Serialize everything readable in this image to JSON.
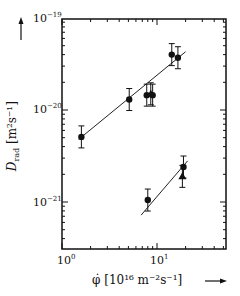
{
  "chart_data": {
    "type": "scatter",
    "title": "",
    "xlabel": "φ̇ [10^16 m^-2 s^-1]",
    "ylabel": "D_rad [m^2 s^-1]",
    "xscale": "log",
    "yscale": "log",
    "xlim": [
      1,
      30
    ],
    "ylim": [
      7e-22,
      1e-19
    ],
    "x_tick_labels": [
      "10^0",
      "10^1"
    ],
    "y_tick_labels": [
      "10^-19",
      "10^-20",
      "10^-21"
    ],
    "grid": false,
    "legend": "none",
    "series": [
      {
        "name": "upper set (circles)",
        "marker": "circle",
        "points": [
          [
            1.6,
            5.1e-21
          ],
          [
            5.1,
            1.3e-20
          ],
          [
            7.8,
            1.45e-20
          ],
          [
            9.0,
            1.45e-20
          ],
          [
            14.3,
            4e-20
          ],
          [
            16.6,
            3.7e-20
          ]
        ]
      },
      {
        "name": "upper set (triangles)",
        "marker": "triangle",
        "points": [
          [
            8.6,
            1.5e-20
          ]
        ]
      },
      {
        "name": "lower set (circles)",
        "marker": "circle",
        "points": [
          [
            8.0,
            1.05e-21
          ],
          [
            19.0,
            2.4e-21
          ]
        ]
      },
      {
        "name": "lower set (triangles)",
        "marker": "triangle",
        "points": [
          [
            18.5,
            1.9e-21
          ]
        ]
      }
    ],
    "fit_lines": [
      {
        "name": "upper fit",
        "from": [
          1.5,
          4.8e-21
        ],
        "to": [
          20,
          4.3e-20
        ]
      },
      {
        "name": "lower fit",
        "from": [
          6.8,
          7.2e-22
        ],
        "to": [
          21,
          2.8e-21
        ]
      }
    ]
  },
  "labels": {
    "y_top": "10",
    "y_top_exp": "−19",
    "y_mid": "10",
    "y_mid_exp": "−20",
    "y_low": "10",
    "y_low_exp": "−21",
    "x_left": "10",
    "x_left_exp": "0",
    "x_mid": "10",
    "x_mid_exp": "1",
    "ylabel_main": "D",
    "ylabel_sub": "rad",
    "ylabel_units": "[m²s⁻¹]",
    "xlabel_sym": "φ̇",
    "xlabel_units": "[10¹⁶  m⁻²s⁻¹]"
  }
}
